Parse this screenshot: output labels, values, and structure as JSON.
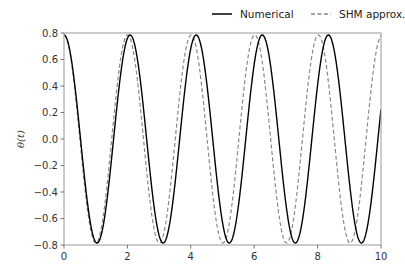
{
  "chart_data": {
    "type": "line",
    "title": "",
    "xlabel": "",
    "ylabel": "θ(t)",
    "xlim": [
      0,
      10
    ],
    "ylim": [
      -0.8,
      0.8
    ],
    "xticks": [
      0,
      2,
      4,
      6,
      8,
      10
    ],
    "xtick_labels": [
      "0",
      "2",
      "4",
      "6",
      "8",
      "10"
    ],
    "yticks": [
      -0.8,
      -0.6,
      -0.4,
      -0.2,
      0.0,
      0.2,
      0.4,
      0.6,
      0.8
    ],
    "ytick_labels": [
      "−0.8",
      "−0.6",
      "−0.4",
      "−0.2",
      "0.0",
      "0.2",
      "0.4",
      "0.6",
      "0.8"
    ],
    "grid": false,
    "legend_position": "upper right, outside above axes",
    "series": [
      {
        "name": "Numerical",
        "style": "solid",
        "color": "#000000",
        "amplitude": 0.785,
        "period": 2.085,
        "x": [
          0,
          0.5,
          1.04,
          1.5,
          2.085,
          2.6,
          3.13,
          3.6,
          4.17,
          4.7,
          5.21,
          5.7,
          6.25,
          6.8,
          7.3,
          7.8,
          8.34,
          8.9,
          9.38,
          10
        ],
        "y": [
          0.785,
          0.03,
          -0.785,
          -0.3,
          0.785,
          0.0,
          -0.785,
          -0.15,
          0.785,
          -0.03,
          -0.785,
          -0.2,
          0.785,
          -0.1,
          -0.785,
          -0.15,
          0.785,
          -0.2,
          -0.785,
          0.22
        ]
      },
      {
        "name": "SHM approx.",
        "style": "dashed",
        "color": "#888888",
        "amplitude": 0.785,
        "period": 2.006,
        "x": [
          0,
          0.5,
          1.0,
          1.5,
          2.0,
          2.5,
          3.0,
          3.5,
          4.0,
          4.5,
          5.0,
          5.5,
          6.0,
          6.5,
          7.0,
          7.5,
          8.0,
          8.5,
          9.0,
          9.5,
          10
        ],
        "y": [
          0.785,
          0.0,
          -0.785,
          0.0,
          0.785,
          0.0,
          -0.785,
          0.0,
          0.785,
          0.0,
          -0.785,
          0.0,
          0.785,
          0.0,
          -0.785,
          0.0,
          0.785,
          0.0,
          -0.785,
          0.0,
          0.785
        ]
      }
    ]
  },
  "legend": {
    "items": [
      {
        "label": "Numerical"
      },
      {
        "label": "SHM approx."
      }
    ]
  }
}
